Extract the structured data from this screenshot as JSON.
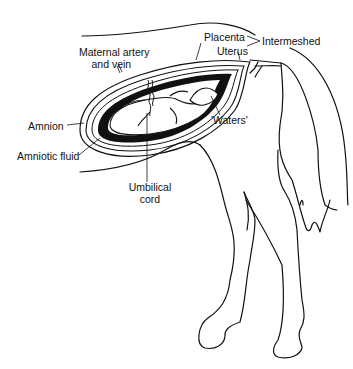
{
  "diagram": {
    "labels": {
      "maternal_artery_line1": "Maternal artery",
      "maternal_artery_line2": "and vein",
      "placenta": "Placenta",
      "uterus": "Uterus",
      "intermeshed": "Intermeshed",
      "waters": "'Waters'",
      "amnion": "Amnion",
      "amniotic_fluid": "Amniotic fluid",
      "umbilical_line1": "Umbilical",
      "umbilical_line2": "cord"
    },
    "colors": {
      "ink": "#111111",
      "background": "#ffffff"
    }
  }
}
